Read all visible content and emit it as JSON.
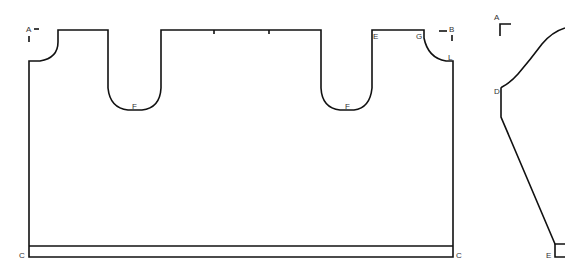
{
  "diagram": {
    "type": "sewing-pattern",
    "stroke_color": "#111111",
    "label_color": "#333333",
    "pieces": [
      {
        "name": "main-panel",
        "labels": {
          "A": "A",
          "B": "B",
          "E": "E",
          "F_left": "F",
          "F_right": "F",
          "G": "G",
          "L": "L",
          "C_left": "C",
          "C_right": "C"
        }
      },
      {
        "name": "side-piece",
        "labels": {
          "A": "A",
          "D": "D",
          "E": "E"
        }
      }
    ]
  }
}
